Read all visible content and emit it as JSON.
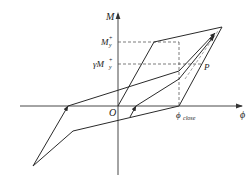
{
  "diagram": {
    "title": "",
    "type": "moment-curvature hysteresis model",
    "axes": {
      "x_label": "ϕ",
      "y_label": "M",
      "origin_label": "O"
    },
    "levels": {
      "yield_label_main": "M",
      "yield_label_sub": "y",
      "yield_label_sup": "+",
      "reduced_label_prefix": "γM",
      "reduced_label_sub": "y",
      "reduced_label_sup": "+"
    },
    "points": {
      "p_label": "P",
      "phi_close_main": "ϕ",
      "phi_close_sub": "close"
    },
    "colors": {
      "line": "#2a2a2a",
      "axis": "#333333",
      "dash": "#444444",
      "background": "#ffffff"
    }
  }
}
